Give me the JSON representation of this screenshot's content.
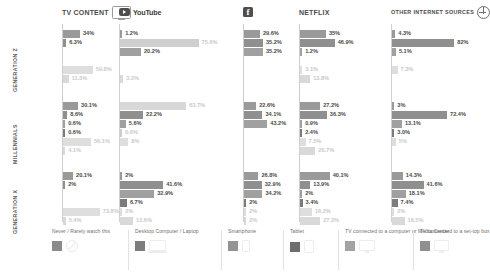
{
  "columns": [
    {
      "id": "tv-content",
      "title": "TV CONTENT",
      "icon": "tv-icon",
      "style": "big"
    },
    {
      "id": "youtube",
      "title": "YouTube",
      "icon": "youtube-icon",
      "style": "wordmark"
    },
    {
      "id": "facebook",
      "title": "",
      "icon": "facebook-icon",
      "style": "icononly"
    },
    {
      "id": "netflix",
      "title": "NETFLIX",
      "icon": "none",
      "style": "big"
    },
    {
      "id": "other",
      "title": "OTHER INTERNET SOURCES",
      "icon": "globe-icon",
      "style": "small"
    }
  ],
  "generations": [
    "GENERATION Z",
    "MILLENNIALS",
    "GENERATION X"
  ],
  "legend": {
    "items": [
      {
        "label": "Never / Rarely watch this",
        "color": "#8a8a8a",
        "icon": "no-entry-icon"
      },
      {
        "label": "Desktop Computer / Laptop",
        "color": "#7d7d7d",
        "icon": "laptop-icon"
      },
      {
        "label": "Smartphone",
        "color": "#949494",
        "icon": "smartphone-icon"
      },
      {
        "label": "Tablet",
        "color": "#6e6e6e",
        "icon": "tablet-icon"
      },
      {
        "label": "TV connected to a computer or Media Center",
        "color": "#a3a3a3",
        "icon": "monitor-icon"
      },
      {
        "label": "TV connected to a set-top box",
        "color": "#8f8f8f",
        "icon": "settopbox-icon"
      }
    ]
  },
  "chart_data": {
    "type": "bar",
    "xlabel": "",
    "ylabel": "",
    "xlim": [
      0,
      100
    ],
    "grid": false,
    "legend_position": "bottom",
    "categories": [
      "Never / Rarely watch this",
      "Desktop Computer / Laptop",
      "Smartphone",
      "Tablet",
      "TV connected to a computer or Media Center",
      "TV connected to a set-top box"
    ],
    "panels": [
      {
        "platform": "TV CONTENT",
        "groups": [
          {
            "generation": "GENERATION Z",
            "values": [
              34,
              6.3,
              null,
              null,
              59.8,
              11.3
            ],
            "labels": [
              "34%",
              "6.3%",
              null,
              null,
              "59.8%",
              "11.3%"
            ],
            "muted": [
              false,
              false,
              null,
              null,
              true,
              true
            ]
          },
          {
            "generation": "MILLENNIALS",
            "values": [
              30.1,
              8.6,
              0.6,
              0.6,
              56.1,
              4.1
            ],
            "labels": [
              "30.1%",
              "8.6%",
              "0.6%",
              "0.6%",
              "56.1%",
              "4.1%"
            ],
            "muted": [
              false,
              false,
              false,
              false,
              true,
              true
            ]
          },
          {
            "generation": "GENERATION X",
            "values": [
              20.1,
              2,
              null,
              null,
              73.8,
              5.4
            ],
            "labels": [
              "20.1%",
              "2%",
              null,
              null,
              "73.8%",
              "5.4%"
            ],
            "muted": [
              false,
              false,
              null,
              null,
              true,
              true
            ]
          }
        ]
      },
      {
        "platform": "YouTube",
        "groups": [
          {
            "generation": "GENERATION Z",
            "values": [
              1.2,
              75.6,
              20.2,
              null,
              null,
              3.2
            ],
            "labels": [
              "1.2%",
              "75.6%",
              "20.2%",
              null,
              null,
              "3.2%"
            ],
            "muted": [
              false,
              true,
              false,
              null,
              null,
              true
            ]
          },
          {
            "generation": "MILLENNIALS",
            "values": [
              63.7,
              22.2,
              5.6,
              0.6,
              8,
              null
            ],
            "labels": [
              "63.7%",
              "22.2%",
              "5.6%",
              "0.6%",
              "8%",
              null
            ],
            "muted": [
              true,
              false,
              false,
              true,
              true,
              null
            ]
          },
          {
            "generation": "GENERATION X",
            "values": [
              2,
              41.6,
              32.9,
              6.7,
              2,
              12.6
            ],
            "labels": [
              "2%",
              "41.6%",
              "32.9%",
              "6.7%",
              "2%",
              "12.6%"
            ],
            "muted": [
              false,
              false,
              false,
              false,
              true,
              true
            ]
          }
        ]
      },
      {
        "platform": "Facebook",
        "groups": [
          {
            "generation": "GENERATION Z",
            "values": [
              29.6,
              35.2,
              35.2,
              null,
              null,
              null
            ],
            "labels": [
              "29.6%",
              "35.2%",
              "35.2%",
              null,
              null,
              null
            ],
            "muted": [
              false,
              false,
              false,
              null,
              null,
              null
            ]
          },
          {
            "generation": "MILLENNIALS",
            "values": [
              22.6,
              34.1,
              43.2,
              null,
              null,
              null
            ],
            "labels": [
              "22.6%",
              "34.1%",
              "43.2%",
              null,
              null,
              null
            ],
            "muted": [
              false,
              false,
              false,
              null,
              null,
              null
            ]
          },
          {
            "generation": "GENERATION X",
            "values": [
              26.8,
              32.9,
              34.2,
              2,
              2,
              2
            ],
            "labels": [
              "26.8%",
              "32.9%",
              "34.2%",
              "2%",
              "2%",
              "2%"
            ],
            "muted": [
              false,
              false,
              false,
              false,
              true,
              true
            ]
          }
        ]
      },
      {
        "platform": "NETFLIX",
        "groups": [
          {
            "generation": "GENERATION Z",
            "values": [
              35,
              46.9,
              1.2,
              null,
              3.1,
              13.8
            ],
            "labels": [
              "35%",
              "46.9%",
              "1.2%",
              null,
              "3.1%",
              "13.8%"
            ],
            "muted": [
              false,
              false,
              false,
              null,
              true,
              true
            ]
          },
          {
            "generation": "MILLENNIALS",
            "values": [
              27.2,
              36.3,
              0.9,
              2.4,
              7.5,
              20.7
            ],
            "labels": [
              "27.2%",
              "36.3%",
              "0.9%",
              "2.4%",
              "7.5%",
              "20.7%"
            ],
            "muted": [
              false,
              false,
              false,
              false,
              true,
              true
            ]
          },
          {
            "generation": "GENERATION X",
            "values": [
              40.1,
              13.9,
              2,
              3.4,
              16.2,
              27.2
            ],
            "labels": [
              "40.1%",
              "13.9%",
              "2%",
              "3.4%",
              "16.2%",
              "27.2%"
            ],
            "muted": [
              false,
              false,
              false,
              false,
              true,
              true
            ]
          }
        ]
      },
      {
        "platform": "OTHER INTERNET SOURCES",
        "groups": [
          {
            "generation": "GENERATION Z",
            "values": [
              4.3,
              82,
              5.1,
              null,
              7.3,
              null
            ],
            "labels": [
              "4.3%",
              "82%",
              "5.1%",
              null,
              "7.3%",
              null
            ],
            "muted": [
              false,
              false,
              false,
              null,
              true,
              null
            ]
          },
          {
            "generation": "MILLENNIALS",
            "values": [
              3,
              72.4,
              13.1,
              3.0,
              5,
              null
            ],
            "labels": [
              "3%",
              "72.4%",
              "13.1%",
              "3.0%",
              "5%",
              null
            ],
            "muted": [
              false,
              false,
              false,
              false,
              true,
              null
            ]
          },
          {
            "generation": "GENERATION X",
            "values": [
              14.3,
              41.6,
              18.1,
              7.4,
              2,
              16.5
            ],
            "labels": [
              "14.3%",
              "41.6%",
              "18.1%",
              "7.4%",
              "2%",
              "16.5%"
            ],
            "muted": [
              false,
              false,
              false,
              false,
              true,
              true
            ]
          }
        ]
      }
    ]
  }
}
